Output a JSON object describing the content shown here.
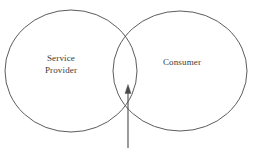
{
  "figure": {
    "type": "venn-two-set",
    "background_color": "#ffffff",
    "stroke_color": "#4a4a4a",
    "text_color": "#3a3a3a",
    "stroke_width": 0.9,
    "left_set": {
      "label": "Service\nProvider",
      "label_line_1": "Service",
      "label_line_2": "Provider",
      "center_x": 71,
      "center_y": 71,
      "radius_x": 66,
      "radius_y": 61
    },
    "right_set": {
      "label": "Consumer",
      "center_x": 180,
      "center_y": 71,
      "radius_x": 67,
      "radius_y": 60
    },
    "intersection": {
      "label": "",
      "top_point_x": 128,
      "top_point_y": 25,
      "bottom_point_x": 128,
      "bottom_point_y": 114
    },
    "arrow": {
      "label": "",
      "direction": "up",
      "head_style": "solid-triangle",
      "x": 128,
      "tail_y": 148,
      "tip_y": 85,
      "head_width": 6,
      "head_height": 9
    }
  }
}
